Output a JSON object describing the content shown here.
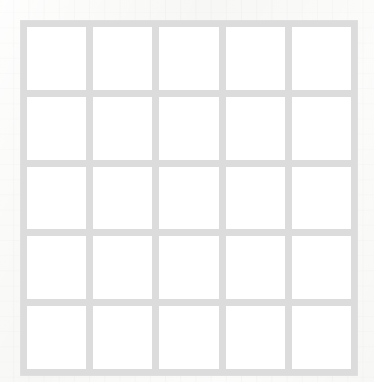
{
  "canvas": {
    "width": 374,
    "height": 382,
    "background_color": "#f7f7f5",
    "description": "Blank 5x5 grid of empty white squares on faint off-white paper"
  },
  "paper": {
    "texture": "faint-graph-paper-rules",
    "rule_spacing_px": 15.2,
    "rule_color": "#f0f0ee"
  },
  "grid": {
    "name": "empty-5x5-grid",
    "rows": 5,
    "columns": 5,
    "line_color": "#dcdcdc",
    "cell_color": "#ffffff",
    "left_px": 20,
    "top_px": 20,
    "width_px": 338,
    "height_px": 356,
    "line_thickness_px": 7,
    "cell_width_px": 60.2,
    "cell_height_px": 63.4,
    "cells": [
      [
        {
          "row": 1,
          "col": 1,
          "label": "",
          "filled": false
        },
        {
          "row": 1,
          "col": 2,
          "label": "",
          "filled": false
        },
        {
          "row": 1,
          "col": 3,
          "label": "",
          "filled": false
        },
        {
          "row": 1,
          "col": 4,
          "label": "",
          "filled": false
        },
        {
          "row": 1,
          "col": 5,
          "label": "",
          "filled": false
        }
      ],
      [
        {
          "row": 2,
          "col": 1,
          "label": "",
          "filled": false
        },
        {
          "row": 2,
          "col": 2,
          "label": "",
          "filled": false
        },
        {
          "row": 2,
          "col": 3,
          "label": "",
          "filled": false
        },
        {
          "row": 2,
          "col": 4,
          "label": "",
          "filled": false
        },
        {
          "row": 2,
          "col": 5,
          "label": "",
          "filled": false
        }
      ],
      [
        {
          "row": 3,
          "col": 1,
          "label": "",
          "filled": false
        },
        {
          "row": 3,
          "col": 2,
          "label": "",
          "filled": false
        },
        {
          "row": 3,
          "col": 3,
          "label": "",
          "filled": false
        },
        {
          "row": 3,
          "col": 4,
          "label": "",
          "filled": false
        },
        {
          "row": 3,
          "col": 5,
          "label": "",
          "filled": false
        }
      ],
      [
        {
          "row": 4,
          "col": 1,
          "label": "",
          "filled": false
        },
        {
          "row": 4,
          "col": 2,
          "label": "",
          "filled": false
        },
        {
          "row": 4,
          "col": 3,
          "label": "",
          "filled": false
        },
        {
          "row": 4,
          "col": 4,
          "label": "",
          "filled": false
        },
        {
          "row": 4,
          "col": 5,
          "label": "",
          "filled": false
        }
      ],
      [
        {
          "row": 5,
          "col": 1,
          "label": "",
          "filled": false
        },
        {
          "row": 5,
          "col": 2,
          "label": "",
          "filled": false
        },
        {
          "row": 5,
          "col": 3,
          "label": "",
          "filled": false
        },
        {
          "row": 5,
          "col": 4,
          "label": "",
          "filled": false
        },
        {
          "row": 5,
          "col": 5,
          "label": "",
          "filled": false
        }
      ]
    ]
  }
}
